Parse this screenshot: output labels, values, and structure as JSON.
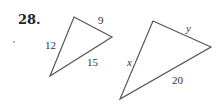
{
  "problem": {
    "number": "28."
  },
  "triangle_small": {
    "sides": {
      "top": "9",
      "left": "12",
      "bottom": "15"
    }
  },
  "triangle_large": {
    "sides": {
      "top": "y",
      "left": "x",
      "bottom": "20"
    }
  },
  "colors": {
    "stroke": "#555555",
    "text": "#333333"
  }
}
